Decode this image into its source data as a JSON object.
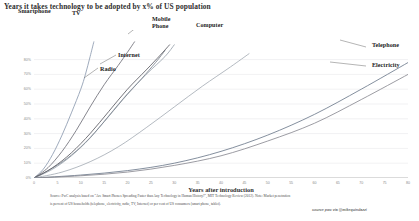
{
  "chart": {
    "title": "Years it takes technology  to be adopted by x% of US population",
    "xlabel": "Years after introduction",
    "note_line1": "Source: PwC analysis based on \"Are Smart Phones Spreading Faster than Any Technology in Human History?\", MIT Technology Review (2012). Note: Market penetration",
    "note_line2": "is percent of US households (telephone, electricity, radio, TV, Internet) or per cent of US consumers (smart phone, tablet).",
    "credit": "source pwc via @mikequindazzi"
  },
  "chart_data": {
    "type": "line",
    "title": "Years it takes technology  to be adopted by x% of US population",
    "xlabel": "Years after introduction",
    "ylabel": "",
    "xlim": [
      0,
      80
    ],
    "ylim": [
      0,
      100
    ],
    "grid": true,
    "legend": "inline-annotations",
    "xticks": [
      0,
      5,
      10,
      15,
      20,
      25,
      30,
      35,
      40,
      45,
      50,
      55,
      60,
      65,
      70,
      75,
      80
    ],
    "xticklabels": [
      "0",
      "5",
      "10",
      "15",
      "20",
      "25",
      "30",
      "35",
      "40",
      "45",
      "50",
      "55",
      "60",
      "65",
      "70",
      "75",
      "80"
    ],
    "yticks": [
      0,
      10,
      20,
      30,
      40,
      50,
      60,
      70,
      80
    ],
    "yticklabels": [
      "0%",
      "10%",
      "20%",
      "30%",
      "40%",
      "50%",
      "60%",
      "70%",
      "80%"
    ],
    "series": [
      {
        "name": "Smartphone",
        "color": "#8d9bb0",
        "label_x": 18,
        "label_y": 8,
        "points": [
          [
            0,
            0
          ],
          [
            2,
            6
          ],
          [
            4,
            16
          ],
          [
            6,
            29
          ],
          [
            8,
            44
          ],
          [
            10,
            60
          ],
          [
            11,
            70
          ],
          [
            12,
            82
          ],
          [
            12.8,
            92
          ]
        ]
      },
      {
        "name": "TV",
        "color": "#6f6f78",
        "label_x": 72,
        "label_y": 10,
        "points": [
          [
            0,
            0
          ],
          [
            3,
            7
          ],
          [
            6,
            18
          ],
          [
            9,
            32
          ],
          [
            12,
            48
          ],
          [
            15,
            63
          ],
          [
            18,
            76
          ],
          [
            20,
            85
          ],
          [
            21.5,
            92
          ]
        ]
      },
      {
        "name": "Mobile Phone",
        "color": "#9aa3ad",
        "label_x": 152,
        "label_y": 16,
        "points": [
          [
            0,
            0
          ],
          [
            4,
            6
          ],
          [
            8,
            15
          ],
          [
            12,
            27
          ],
          [
            16,
            42
          ],
          [
            20,
            57
          ],
          [
            24,
            70
          ],
          [
            28,
            82
          ],
          [
            30,
            90
          ]
        ]
      },
      {
        "name": "Internet",
        "color": "#7c848f",
        "label_x": 118,
        "label_y": 52,
        "points": [
          [
            0,
            0
          ],
          [
            3,
            5
          ],
          [
            7,
            13
          ],
          [
            11,
            24
          ],
          [
            15,
            38
          ],
          [
            19,
            53
          ],
          [
            23,
            67
          ],
          [
            26,
            78
          ],
          [
            28,
            86
          ]
        ]
      },
      {
        "name": "Radio",
        "color": "#5c5c63",
        "label_x": 100,
        "label_y": 66,
        "points": [
          [
            0,
            0
          ],
          [
            4,
            7
          ],
          [
            8,
            17
          ],
          [
            12,
            30
          ],
          [
            16,
            45
          ],
          [
            20,
            60
          ],
          [
            24,
            73
          ],
          [
            27,
            83
          ],
          [
            29,
            90
          ]
        ]
      },
      {
        "name": "Computer",
        "color": "#a6adb6",
        "label_x": 196,
        "label_y": 22,
        "points": [
          [
            0,
            0
          ],
          [
            6,
            4
          ],
          [
            12,
            11
          ],
          [
            18,
            21
          ],
          [
            24,
            34
          ],
          [
            30,
            48
          ],
          [
            36,
            62
          ],
          [
            42,
            75
          ],
          [
            46,
            84
          ]
        ]
      },
      {
        "name": "Telephone",
        "color": "#6e7b8c",
        "label_x": 372,
        "label_y": 42,
        "points": [
          [
            0,
            0
          ],
          [
            10,
            2
          ],
          [
            20,
            5
          ],
          [
            30,
            10
          ],
          [
            40,
            18
          ],
          [
            50,
            29
          ],
          [
            60,
            43
          ],
          [
            70,
            60
          ],
          [
            80,
            78
          ]
        ]
      },
      {
        "name": "Electricity",
        "color": "#8a8a92",
        "label_x": 372,
        "label_y": 62,
        "points": [
          [
            0,
            0
          ],
          [
            10,
            1.5
          ],
          [
            20,
            4
          ],
          [
            30,
            8.5
          ],
          [
            40,
            15
          ],
          [
            50,
            25
          ],
          [
            60,
            37
          ],
          [
            70,
            53
          ],
          [
            80,
            70
          ]
        ]
      }
    ],
    "annotations": [
      {
        "name": "Smartphone",
        "has_leader": false
      },
      {
        "name": "TV",
        "has_leader": false
      },
      {
        "name": "Mobile Phone",
        "has_leader": true
      },
      {
        "name": "Internet",
        "has_leader": true
      },
      {
        "name": "Radio",
        "has_leader": true
      },
      {
        "name": "Computer",
        "has_leader": false
      },
      {
        "name": "Telephone",
        "has_leader": true
      },
      {
        "name": "Electricity",
        "has_leader": true
      }
    ]
  }
}
